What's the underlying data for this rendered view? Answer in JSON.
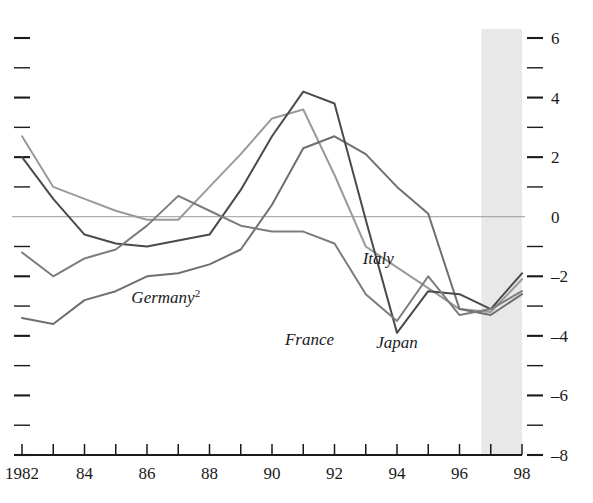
{
  "chart_data": {
    "type": "line",
    "title": "",
    "subtitle": "",
    "xlabel": "",
    "ylabel": "",
    "xlim": [
      1982,
      1998
    ],
    "ylim": [
      -8,
      6
    ],
    "grid": false,
    "legend_position": "inline-annotations",
    "zero_line": 0,
    "x_tick_labels": [
      "1982",
      "",
      "84",
      "",
      "86",
      "",
      "88",
      "",
      "90",
      "",
      "92",
      "",
      "94",
      "",
      "96",
      "",
      "98"
    ],
    "x_tick_values": [
      1982,
      1983,
      1984,
      1985,
      1986,
      1987,
      1988,
      1989,
      1990,
      1991,
      1992,
      1993,
      1994,
      1995,
      1996,
      1997,
      1998
    ],
    "y_tick_labels_right": [
      "6",
      "",
      "4",
      "",
      "2",
      "",
      "0",
      "",
      "-2",
      "",
      "-4",
      "",
      "-6",
      "",
      "-8"
    ],
    "y_tick_values": [
      6,
      5,
      4,
      3,
      2,
      1,
      0,
      -1,
      -2,
      -3,
      -4,
      -5,
      -6,
      -7,
      -8
    ],
    "y_major_values": [
      6,
      4,
      2,
      0,
      -2,
      -4,
      -6,
      -8
    ],
    "y_axis_side": "right",
    "left_axis_ticks_unlabeled": true,
    "shaded_region": {
      "label": "",
      "x_start": 1996.7,
      "x_end": 1998,
      "color": "#e8e8e8"
    },
    "x": [
      1982,
      1983,
      1984,
      1985,
      1986,
      1987,
      1988,
      1989,
      1990,
      1991,
      1992,
      1993,
      1994,
      1995,
      1996,
      1997,
      1998
    ],
    "series": [
      {
        "name": "Italy",
        "color": "#9a9a9a",
        "values": [
          2.7,
          1.0,
          0.6,
          0.2,
          -0.1,
          -0.1,
          1.0,
          2.1,
          3.3,
          3.6,
          1.4,
          -1.0,
          -1.7,
          -2.4,
          -3.1,
          -3.2,
          -2.1
        ]
      },
      {
        "name": "Germany",
        "color": "#6f6f6f",
        "values": [
          -3.4,
          -3.6,
          -2.8,
          -2.5,
          -2.0,
          -1.9,
          -1.6,
          -1.1,
          0.4,
          2.3,
          2.7,
          2.1,
          1.0,
          0.1,
          -3.1,
          -3.3,
          -2.6
        ]
      },
      {
        "name": "France",
        "color": "#4a4a4a",
        "values": [
          2.0,
          0.6,
          -0.6,
          -0.9,
          -1.0,
          -0.8,
          -0.6,
          0.9,
          2.7,
          4.2,
          3.8,
          -0.1,
          -3.9,
          -2.5,
          -2.6,
          -3.1,
          -1.9
        ]
      },
      {
        "name": "Japan",
        "color": "#7c7c7c",
        "values": [
          -1.2,
          -2.0,
          -1.4,
          -1.1,
          -0.3,
          0.7,
          0.2,
          -0.3,
          -0.5,
          -0.5,
          -0.9,
          -2.6,
          -3.5,
          -2.0,
          -3.3,
          -3.1,
          -2.5
        ]
      }
    ],
    "annotations": [
      {
        "text": "Germany",
        "superscript": "2",
        "x": 1986.6,
        "y": -2.9,
        "name": "germany"
      },
      {
        "text": "Italy",
        "superscript": "",
        "x": 1993.4,
        "y": -1.6,
        "name": "italy"
      },
      {
        "text": "France",
        "superscript": "",
        "x": 1991.2,
        "y": -4.3,
        "name": "france"
      },
      {
        "text": "Japan",
        "superscript": "",
        "x": 1994.0,
        "y": -4.4,
        "name": "japan"
      }
    ]
  },
  "colors": {
    "background": "#ffffff",
    "axis": "#1a1a1a",
    "zero_line": "#9a9a9a",
    "shade": "#e8e8e8"
  }
}
